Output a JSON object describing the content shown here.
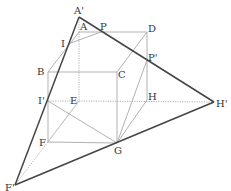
{
  "diagram": {
    "type": "cube-cross-section",
    "colors": {
      "background": "#ffffff",
      "cube_edge": "#a8a8a8",
      "hidden_edge": "#a8a8a8",
      "section_line": "#444444",
      "label": "#333333"
    },
    "points": {
      "A_prime": {
        "label": "A'",
        "x": 79,
        "y": 17
      },
      "A": {
        "label": "A",
        "x": 79,
        "y": 32
      },
      "P": {
        "label": "P",
        "x": 101,
        "y": 32
      },
      "D": {
        "label": "D",
        "x": 147,
        "y": 32
      },
      "I": {
        "label": "I",
        "x": 68,
        "y": 44
      },
      "B": {
        "label": "B",
        "x": 48,
        "y": 72
      },
      "C": {
        "label": "C",
        "x": 117,
        "y": 72
      },
      "P_prime": {
        "label": "P'",
        "x": 147,
        "y": 60
      },
      "I_prime": {
        "label": "I'",
        "x": 48,
        "y": 101
      },
      "E": {
        "label": "E",
        "x": 79,
        "y": 101
      },
      "H": {
        "label": "H",
        "x": 147,
        "y": 100
      },
      "H_prime": {
        "label": "H'",
        "x": 214,
        "y": 102
      },
      "F": {
        "label": "F",
        "x": 48,
        "y": 142
      },
      "G": {
        "label": "G",
        "x": 117,
        "y": 143
      },
      "F_prime": {
        "label": "F'",
        "x": 15,
        "y": 185
      }
    }
  }
}
